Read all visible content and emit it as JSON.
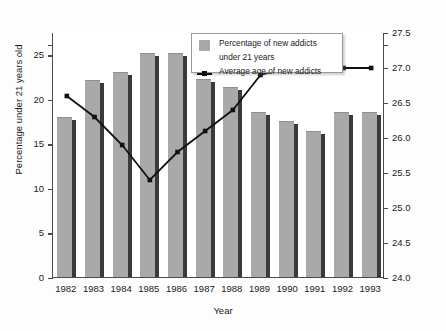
{
  "chart_data": {
    "type": "bar",
    "title": "",
    "xlabel": "Year",
    "ylabel": "Percentage under 21 years old",
    "y2label": "Average age (years)",
    "categories": [
      "1982",
      "1983",
      "1984",
      "1985",
      "1986",
      "1987",
      "1988",
      "1989",
      "1990",
      "1991",
      "1992",
      "1993"
    ],
    "ylim": [
      0,
      27.5
    ],
    "y2lim": [
      24.0,
      27.5
    ],
    "yticks": [
      "25",
      "20",
      "15",
      "10",
      "5",
      "0"
    ],
    "ytick_values": [
      25,
      20,
      15,
      10,
      5,
      0
    ],
    "y2ticks": [
      "27.5",
      "27.0",
      "26.5",
      "26.0",
      "25.5",
      "25.0",
      "24.5",
      "24.0"
    ],
    "y2tick_values": [
      27.5,
      27.0,
      26.5,
      26.0,
      25.5,
      25.0,
      24.5,
      24.0
    ],
    "grid": false,
    "legend_position": "top-center",
    "series": [
      {
        "name": "Percentage of new addicts under 21 years",
        "type": "bar",
        "axis": "left",
        "color": "#a9a9a9",
        "values": [
          18.0,
          22.1,
          23.0,
          25.2,
          25.2,
          22.2,
          21.3,
          18.5,
          17.5,
          16.4,
          18.5,
          18.5
        ]
      },
      {
        "name": "Average age of new addicts",
        "type": "line",
        "axis": "right",
        "color": "#111111",
        "values": [
          26.6,
          26.3,
          25.9,
          25.4,
          25.8,
          26.1,
          26.4,
          26.9,
          27.0,
          27.4,
          27.0,
          27.0
        ]
      }
    ]
  },
  "legend": {
    "bar_label_line1": "Percentage of new addicts",
    "bar_label_line2": "under 21 years",
    "line_label": "Average age of new addicts"
  },
  "axes": {
    "x_title": "Year",
    "y_left_title": "Percentage under 21 years old",
    "y_right_title": "Average age (years)"
  }
}
